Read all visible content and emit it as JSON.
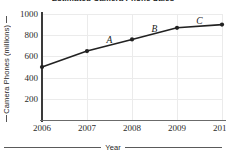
{
  "chart_data": {
    "type": "line",
    "title": "Estimated Camera Phone Sales",
    "xlabel": "Year",
    "ylabel": "Camera Phones (millions)",
    "categories": [
      "2006",
      "2007",
      "2008",
      "2009",
      "2010"
    ],
    "x": [
      2006,
      2007,
      2008,
      2009,
      2010
    ],
    "values": [
      500,
      650,
      760,
      870,
      900
    ],
    "series": [
      {
        "name": "Camera phone sales",
        "values": [
          500,
          650,
          760,
          870,
          900
        ]
      }
    ],
    "xlim": [
      2006,
      2010
    ],
    "ylim": [
      0,
      1000
    ],
    "ytick_labels": [
      "200",
      "400",
      "600",
      "800",
      "1000"
    ],
    "ytick_values": [
      200,
      400,
      600,
      800,
      1000
    ],
    "xtick_labels": [
      "2006",
      "2007",
      "2008",
      "2009",
      "2010"
    ],
    "grid": true,
    "legend": false,
    "marker": "filled-circle",
    "line_color": "#222222",
    "grid_color": "#ebebeb",
    "annotations": [
      {
        "text": "A",
        "segment": "2007-2008",
        "x": 2007.5,
        "y": 705
      },
      {
        "text": "B",
        "segment": "2008-2009",
        "x": 2008.5,
        "y": 815
      },
      {
        "text": "C",
        "segment": "2009-2010",
        "x": 2009.5,
        "y": 885
      }
    ]
  },
  "axes": {
    "y_title": "Camera Phones (millions)",
    "x_title": "Year"
  }
}
